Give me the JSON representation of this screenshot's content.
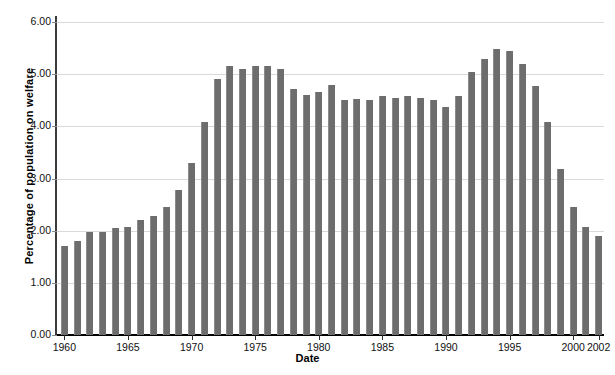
{
  "chart_data": {
    "type": "bar",
    "title": "",
    "xlabel": "Date",
    "ylabel": "Percentage of population on welfare",
    "ylim": [
      0.0,
      6.0
    ],
    "ytick_labels": [
      "0.00",
      "1.00",
      "2.00",
      "3.00",
      "4.00",
      "5.00",
      "6.00"
    ],
    "ytick_values": [
      0,
      1,
      2,
      3,
      4,
      5,
      6
    ],
    "xtick_labels": [
      "1960",
      "1965",
      "1970",
      "1975",
      "1980",
      "1985",
      "1990",
      "1995",
      "2000",
      "2002"
    ],
    "xtick_values": [
      1960,
      1965,
      1970,
      1975,
      1980,
      1985,
      1990,
      1995,
      2000,
      2002
    ],
    "grid": true,
    "legend": "none",
    "bar_color": "#6d6d6d",
    "categories": [
      "1960",
      "1961",
      "1962",
      "1963",
      "1964",
      "1965",
      "1966",
      "1967",
      "1968",
      "1969",
      "1970",
      "1971",
      "1972",
      "1973",
      "1974",
      "1975",
      "1976",
      "1977",
      "1978",
      "1979",
      "1980",
      "1981",
      "1982",
      "1983",
      "1984",
      "1985",
      "1986",
      "1987",
      "1988",
      "1989",
      "1990",
      "1991",
      "1992",
      "1993",
      "1994",
      "1995",
      "1996",
      "1997",
      "1998",
      "1999",
      "2000",
      "2001",
      "2002"
    ],
    "values": [
      1.7,
      1.8,
      1.97,
      1.97,
      2.05,
      2.08,
      2.2,
      2.28,
      2.45,
      2.78,
      3.3,
      4.08,
      4.9,
      5.15,
      5.1,
      5.15,
      5.15,
      5.1,
      4.72,
      4.6,
      4.65,
      4.8,
      4.5,
      4.52,
      4.5,
      4.58,
      4.55,
      4.58,
      4.55,
      4.5,
      4.38,
      4.58,
      5.05,
      5.3,
      5.48,
      5.45,
      5.2,
      4.78,
      4.08,
      3.18,
      2.45,
      2.08,
      1.9
    ]
  }
}
